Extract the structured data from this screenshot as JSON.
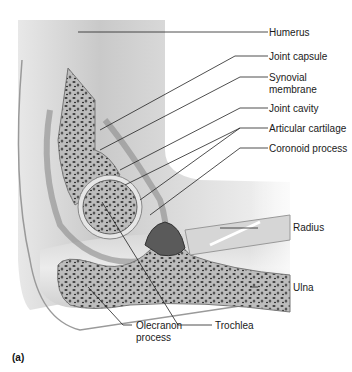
{
  "figure": {
    "panel_label": "(a)",
    "labels": {
      "humerus": "Humerus",
      "joint_capsule": "Joint capsule",
      "synovial_1": "Synovial",
      "synovial_2": "membrane",
      "joint_cavity": "Joint cavity",
      "articular_cartilage": "Articular cartilage",
      "coronoid_process": "Coronoid process",
      "radius": "Radius",
      "ulna": "Ulna",
      "olecranon_1": "Olecranon",
      "olecranon_2": "process",
      "trochlea": "Trochlea"
    }
  }
}
